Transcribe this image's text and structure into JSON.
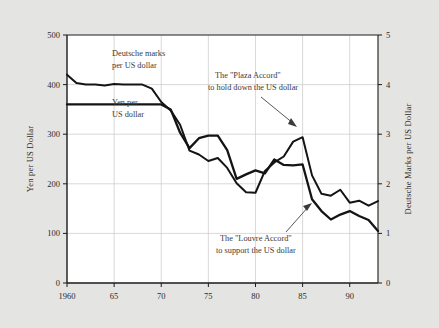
{
  "figure": {
    "background_color": "#e4e4e2",
    "plot_background_color": "#ffffff",
    "line_color": "#141414",
    "grid_color": "#c9c9c9",
    "axis_color": "#1a1a1a"
  },
  "left_axis": {
    "title": "Yen per US Dollar",
    "ticks": [
      "0",
      "100",
      "200",
      "300",
      "400",
      "500"
    ]
  },
  "right_axis": {
    "title": "Deutsche Marks per US Dollar",
    "ticks": [
      "0",
      "1",
      "2",
      "3",
      "4",
      "5"
    ]
  },
  "x_axis": {
    "ticks": [
      "1960",
      "65",
      "70",
      "75",
      "80",
      "85",
      "90"
    ]
  },
  "series_labels": {
    "dm_line1": "Deutsche marks",
    "dm_line2": "per US dollar",
    "yen_line1": "Yen per",
    "yen_line2": "US dollar"
  },
  "annotations": {
    "plaza_line1": "The \"Plaza Accord\"",
    "plaza_line2": "to hold down the US dollar",
    "louvre_line1": "The \"Louvre Accord\"",
    "louvre_line2": "to support the US dollar"
  },
  "caption": "",
  "chart_data": {
    "type": "line",
    "title": "",
    "xlabel": "",
    "ylabel": "Yen per US Dollar",
    "y2label": "Deutsche Marks per US Dollar",
    "xlim": [
      1960,
      1993
    ],
    "ylim": [
      0,
      500
    ],
    "y2lim": [
      0,
      5
    ],
    "grid": true,
    "legend": "inline-labels",
    "xticks": [
      1960,
      1965,
      1970,
      1975,
      1980,
      1985,
      1990
    ],
    "xticklabels": [
      "1960",
      "65",
      "70",
      "75",
      "80",
      "85",
      "90"
    ],
    "yticks": [
      0,
      100,
      200,
      300,
      400,
      500
    ],
    "y2ticks": [
      0,
      1,
      2,
      3,
      4,
      5
    ],
    "series": [
      {
        "name": "Yen per US dollar",
        "axis": "left",
        "x": [
          1960,
          1961,
          1962,
          1963,
          1964,
          1965,
          1966,
          1967,
          1968,
          1969,
          1970,
          1971,
          1972,
          1973,
          1974,
          1975,
          1976,
          1977,
          1978,
          1979,
          1980,
          1981,
          1982,
          1983,
          1984,
          1985,
          1986,
          1987,
          1988,
          1989,
          1990,
          1991,
          1992,
          1993
        ],
        "values": [
          360,
          360,
          360,
          360,
          360,
          360,
          360,
          360,
          360,
          360,
          360,
          350,
          303,
          272,
          292,
          297,
          297,
          268,
          210,
          219,
          227,
          221,
          249,
          238,
          237,
          239,
          169,
          145,
          128,
          138,
          145,
          135,
          127,
          105
        ]
      },
      {
        "name": "Deutsche marks per US dollar",
        "axis": "right",
        "x": [
          1960,
          1961,
          1962,
          1963,
          1964,
          1965,
          1966,
          1967,
          1968,
          1969,
          1970,
          1971,
          1972,
          1973,
          1974,
          1975,
          1976,
          1977,
          1978,
          1979,
          1980,
          1981,
          1982,
          1983,
          1984,
          1985,
          1986,
          1987,
          1988,
          1989,
          1990,
          1991,
          1992,
          1993
        ],
        "values_dm": [
          4.2,
          4.03,
          4.0,
          4.0,
          3.98,
          4.01,
          4.0,
          4.0,
          4.0,
          3.92,
          3.65,
          3.48,
          3.19,
          2.67,
          2.59,
          2.46,
          2.52,
          2.32,
          2.01,
          1.83,
          1.82,
          2.26,
          2.43,
          2.55,
          2.85,
          2.94,
          2.17,
          1.8,
          1.76,
          1.88,
          1.62,
          1.66,
          1.56,
          1.65
        ],
        "values_yen_scale": [
          420,
          403,
          400,
          400,
          398,
          401,
          400,
          400,
          400,
          392,
          365,
          348,
          319,
          267,
          259,
          246,
          252,
          232,
          201,
          183,
          182,
          226,
          243,
          255,
          285,
          294,
          217,
          180,
          176,
          188,
          162,
          166,
          156,
          165
        ]
      }
    ],
    "annotations": [
      {
        "text": "The \"Plaza Accord\" to hold down the US dollar",
        "points_to_year": 1985,
        "points_to_value_dm": 2.94
      },
      {
        "text": "The \"Louvre Accord\" to support the US dollar",
        "points_to_year": 1987,
        "points_to_value_dm": 1.8
      }
    ]
  }
}
